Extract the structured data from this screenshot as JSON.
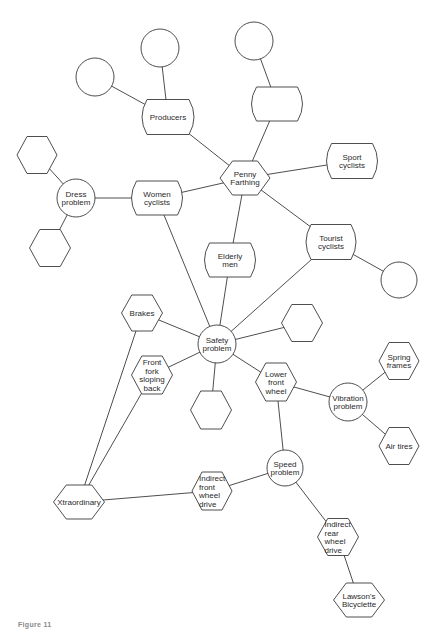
{
  "diagram": {
    "caption": "Figure 11",
    "nodes": [
      {
        "id": "c_topleft",
        "shape": "circle",
        "x": 95,
        "y": 77,
        "r": 19,
        "lines": []
      },
      {
        "id": "c_top",
        "shape": "circle",
        "x": 160,
        "y": 48,
        "r": 19,
        "lines": []
      },
      {
        "id": "producers",
        "shape": "barrel",
        "x": 168,
        "y": 117,
        "w": 52,
        "h": 35,
        "lines": [
          "Producers"
        ]
      },
      {
        "id": "c_topright",
        "shape": "circle",
        "x": 254,
        "y": 41,
        "r": 19,
        "lines": []
      },
      {
        "id": "barrel_blank",
        "shape": "barrel",
        "x": 277,
        "y": 104,
        "w": 51,
        "h": 34,
        "lines": []
      },
      {
        "id": "penny_farthing",
        "shape": "hexagon",
        "x": 245,
        "y": 178,
        "w": 50,
        "h": 34,
        "lines": [
          "Penny",
          "Farthing"
        ]
      },
      {
        "id": "sport_cyclists",
        "shape": "barrel",
        "x": 352,
        "y": 161,
        "w": 51,
        "h": 35,
        "lines": [
          "Sport",
          "cyclists"
        ]
      },
      {
        "id": "women_cyclists",
        "shape": "barrel",
        "x": 157,
        "y": 198,
        "w": 51,
        "h": 34,
        "lines": [
          "Women",
          "cyclists"
        ]
      },
      {
        "id": "dress_problem",
        "shape": "circle",
        "x": 76,
        "y": 198,
        "r": 19,
        "lines": [
          "Dress",
          "problem"
        ]
      },
      {
        "id": "hex_ul",
        "shape": "hexagon",
        "x": 37,
        "y": 155,
        "w": 40,
        "h": 37,
        "lines": []
      },
      {
        "id": "hex_ll",
        "shape": "hexagon",
        "x": 50,
        "y": 248,
        "w": 41,
        "h": 37,
        "lines": []
      },
      {
        "id": "elderly_men",
        "shape": "barrel",
        "x": 230,
        "y": 260,
        "w": 51,
        "h": 34,
        "lines": [
          "Elderly",
          "men"
        ]
      },
      {
        "id": "tourist_cyclists",
        "shape": "barrel",
        "x": 331,
        "y": 242,
        "w": 50,
        "h": 35,
        "lines": [
          "Tourist",
          "cyclists"
        ]
      },
      {
        "id": "c_right",
        "shape": "circle",
        "x": 399,
        "y": 280,
        "r": 18,
        "lines": []
      },
      {
        "id": "brakes",
        "shape": "hexagon",
        "x": 142,
        "y": 313,
        "w": 41,
        "h": 36,
        "lines": [
          "Brakes"
        ]
      },
      {
        "id": "safety_problem",
        "shape": "circle",
        "x": 217,
        "y": 344,
        "r": 19,
        "lines": [
          "Safety",
          "problem"
        ]
      },
      {
        "id": "hex_right",
        "shape": "hexagon",
        "x": 302,
        "y": 323,
        "w": 41,
        "h": 37,
        "lines": []
      },
      {
        "id": "front_fork",
        "shape": "hexagon",
        "x": 152,
        "y": 375,
        "w": 41,
        "h": 38,
        "lines": [
          "Front",
          "fork",
          "sloping",
          "back"
        ]
      },
      {
        "id": "hex_bottom",
        "shape": "hexagon",
        "x": 211,
        "y": 410,
        "w": 41,
        "h": 38,
        "lines": []
      },
      {
        "id": "lower_front_wheel",
        "shape": "hexagon",
        "x": 276,
        "y": 382,
        "w": 41,
        "h": 38,
        "lines": [
          "Lower",
          "front",
          "wheel"
        ]
      },
      {
        "id": "vibration_problem",
        "shape": "circle",
        "x": 348,
        "y": 402,
        "r": 19,
        "lines": [
          "Vibration",
          "problem"
        ]
      },
      {
        "id": "spring_frames",
        "shape": "hexagon",
        "x": 399,
        "y": 361,
        "w": 40,
        "h": 37,
        "lines": [
          "Spring",
          "frames"
        ]
      },
      {
        "id": "air_tires",
        "shape": "hexagon",
        "x": 399,
        "y": 446,
        "w": 40,
        "h": 37,
        "lines": [
          "Air tires"
        ]
      },
      {
        "id": "speed_problem",
        "shape": "circle",
        "x": 285,
        "y": 468,
        "r": 18,
        "lines": [
          "Speed",
          "problem"
        ]
      },
      {
        "id": "xtraordinary",
        "shape": "hexagon",
        "x": 79,
        "y": 502,
        "w": 51,
        "h": 34,
        "lines": [
          "Xtraordinary"
        ]
      },
      {
        "id": "indirect_front",
        "shape": "hexagon",
        "x": 212,
        "y": 491,
        "w": 40,
        "h": 38,
        "lines": [
          "Indirect",
          "front",
          "wheel",
          "drive"
        ],
        "align": "left"
      },
      {
        "id": "indirect_rear",
        "shape": "hexagon",
        "x": 338,
        "y": 537,
        "w": 41,
        "h": 37,
        "lines": [
          "Indirect",
          "rear",
          "wheel",
          "drive"
        ],
        "align": "left"
      },
      {
        "id": "lawsons_bicyclette",
        "shape": "hexagon",
        "x": 359,
        "y": 600,
        "w": 51,
        "h": 34,
        "lines": [
          "Lawson's",
          "Bicyclette"
        ]
      }
    ],
    "edges": [
      [
        "c_topleft",
        "producers"
      ],
      [
        "c_top",
        "producers"
      ],
      [
        "producers",
        "penny_farthing"
      ],
      [
        "c_topright",
        "barrel_blank"
      ],
      [
        "barrel_blank",
        "penny_farthing"
      ],
      [
        "penny_farthing",
        "sport_cyclists"
      ],
      [
        "penny_farthing",
        "women_cyclists"
      ],
      [
        "penny_farthing",
        "elderly_men"
      ],
      [
        "penny_farthing",
        "tourist_cyclists"
      ],
      [
        "women_cyclists",
        "dress_problem"
      ],
      [
        "dress_problem",
        "hex_ul"
      ],
      [
        "dress_problem",
        "hex_ll"
      ],
      [
        "women_cyclists",
        "safety_problem"
      ],
      [
        "elderly_men",
        "safety_problem"
      ],
      [
        "tourist_cyclists",
        "safety_problem"
      ],
      [
        "tourist_cyclists",
        "c_right"
      ],
      [
        "brakes",
        "safety_problem"
      ],
      [
        "safety_problem",
        "hex_right"
      ],
      [
        "front_fork",
        "safety_problem"
      ],
      [
        "safety_problem",
        "hex_bottom"
      ],
      [
        "safety_problem",
        "lower_front_wheel"
      ],
      [
        "lower_front_wheel",
        "vibration_problem"
      ],
      [
        "vibration_problem",
        "spring_frames"
      ],
      [
        "vibration_problem",
        "air_tires"
      ],
      [
        "lower_front_wheel",
        "speed_problem"
      ],
      [
        "brakes",
        "xtraordinary"
      ],
      [
        "front_fork",
        "xtraordinary"
      ],
      [
        "xtraordinary",
        "indirect_front"
      ],
      [
        "indirect_front",
        "speed_problem"
      ],
      [
        "speed_problem",
        "indirect_rear"
      ],
      [
        "indirect_rear",
        "lawsons_bicyclette"
      ]
    ],
    "colors": {
      "stroke": "#3a3a3a",
      "text": "#2a2a2a",
      "background": "#ffffff",
      "caption": "#8a8a8a"
    }
  }
}
